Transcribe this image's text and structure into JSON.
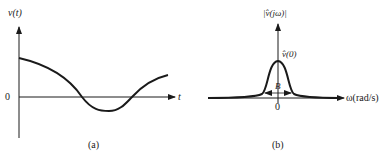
{
  "panel_a": {
    "y_label": "v(t)",
    "x_label": "t",
    "zero_label": "0",
    "caption": "(a)"
  },
  "panel_b": {
    "y_label": "|v̂(jω)|",
    "peak_label": "v̂(0)",
    "bandwidth_label": "B",
    "x_label": "ω(rad/s)",
    "zero_label": "0",
    "caption": "(b)"
  },
  "colors": {
    "ink": "#1a1a1a",
    "background": "#ffffff"
  }
}
